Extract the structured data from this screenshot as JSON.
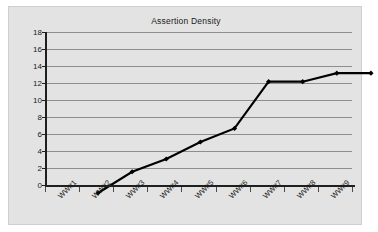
{
  "chart_data": {
    "type": "line",
    "title": "Assertion Density",
    "xlabel": "",
    "ylabel": "",
    "categories": [
      "WW#1",
      "WW#2",
      "WW#3",
      "WW#4",
      "WW#5",
      "WW#6",
      "WW#7",
      "WW#8",
      "WW#9"
    ],
    "series": [
      {
        "name": "Assertion Density",
        "values": [
          2.0,
          4.5,
          6.0,
          8.0,
          9.6,
          15.1,
          15.1,
          16.1,
          16.1
        ]
      }
    ],
    "ylim": [
      0,
      18
    ],
    "yticks": [
      0,
      2,
      4,
      6,
      8,
      10,
      12,
      14,
      16,
      18
    ],
    "ytick_labels": [
      "0",
      "2",
      "4",
      "6",
      "8",
      "10",
      "12",
      "14",
      "16",
      "18"
    ],
    "grid": true,
    "grid_axis": "y",
    "legend": false,
    "legend_position": "none",
    "marker": "diamond",
    "line_color": "#000000",
    "marker_color": "#000000",
    "plot_background": "#e3e3e3",
    "gridline_color": "#8e8e8e",
    "axis_color": "#1f1f1f",
    "text_color": "#1a1a1a",
    "xlabel_rotation": -45
  }
}
